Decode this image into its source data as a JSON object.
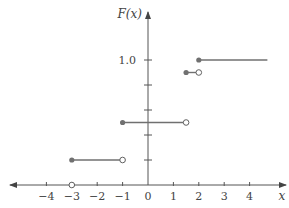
{
  "chart_data": {
    "type": "line",
    "subtype": "step-function-cdf",
    "title": "",
    "xlabel": "x",
    "ylabel": "F(x)",
    "xlim": [
      -4.9,
      5.2
    ],
    "ylim": [
      0,
      1.1
    ],
    "x_ticks": [
      -4,
      -3,
      -2,
      -1,
      0,
      1,
      2,
      3,
      4
    ],
    "x_tick_labels": [
      "−4",
      "−3",
      "−2",
      "−1",
      "0",
      "1",
      "2",
      "3",
      "4"
    ],
    "y_ticks": [
      0.2,
      0.4,
      0.6,
      0.8,
      1.0
    ],
    "y_tick_labels": [
      "",
      "",
      "",
      "",
      "1.0"
    ],
    "grid": false,
    "legend": null,
    "segments": [
      {
        "x_start": -3,
        "x_end": -1,
        "y": 0.2,
        "start": "closed",
        "end": "open"
      },
      {
        "x_start": -1,
        "x_end": 1.5,
        "y": 0.5,
        "start": "closed",
        "end": "open"
      },
      {
        "x_start": 1.5,
        "x_end": 2,
        "y": 0.9,
        "start": "closed",
        "end": "open"
      },
      {
        "x_start": 2,
        "x_end": 4.7,
        "y": 1.0,
        "start": "closed",
        "end": "none"
      }
    ],
    "extra_points": [
      {
        "x": -3,
        "y": 0,
        "style": "open"
      }
    ],
    "colors": {
      "axis": "#555555",
      "segment": "#707070",
      "filled_dot": "#707070",
      "open_dot_stroke": "#606060"
    }
  }
}
